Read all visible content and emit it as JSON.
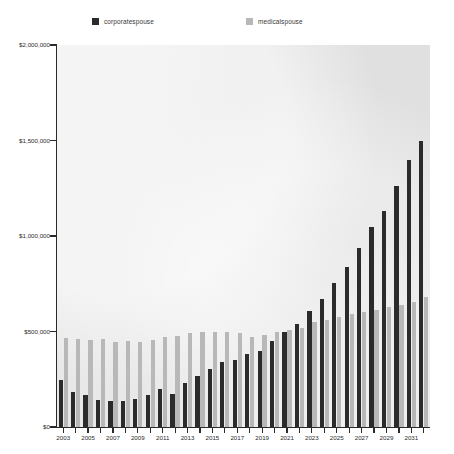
{
  "legend": {
    "items": [
      {
        "label": "corporatespouse",
        "color": "#2b2b2b",
        "icon": "square-swatch-icon"
      },
      {
        "label": "medicalspouse",
        "color": "#b8b8b8",
        "icon": "square-swatch-icon"
      }
    ]
  },
  "axes": {
    "y_ticks": [
      "$2,000,000",
      "$1,500,000",
      "$1,000,000",
      "$500,000",
      "$0"
    ],
    "x_ticks": [
      "2003",
      "2005",
      "2007",
      "2009",
      "2011",
      "2013",
      "2015",
      "2017",
      "2019",
      "2021",
      "2023",
      "2025",
      "2027",
      "2029",
      "2031"
    ]
  },
  "chart_data": {
    "type": "bar",
    "title": "",
    "subtitle": "",
    "xlabel": "",
    "ylabel": "",
    "ylim": [
      0,
      2000000
    ],
    "ytick_values": [
      2000000,
      1500000,
      1000000,
      500000,
      0
    ],
    "ytick_labels": [
      "$2,000,000",
      "$1,500,000",
      "$1,000,000",
      "$500,000",
      "$0"
    ],
    "grid": false,
    "legend_position": "top",
    "categories": [
      "2003",
      "2004",
      "2005",
      "2006",
      "2007",
      "2008",
      "2009",
      "2010",
      "2011",
      "2012",
      "2013",
      "2014",
      "2015",
      "2016",
      "2017",
      "2018",
      "2019",
      "2020",
      "2021",
      "2022",
      "2023",
      "2024",
      "2025",
      "2026",
      "2027",
      "2028",
      "2029",
      "2030",
      "2031",
      "2032"
    ],
    "series": [
      {
        "name": "corporatespouse",
        "color": "#2b2b2b",
        "values": [
          248000,
          185000,
          168000,
          142000,
          137000,
          138000,
          145000,
          170000,
          198000,
          172000,
          232000,
          268000,
          305000,
          340000,
          352000,
          382000,
          398000,
          452000,
          500000,
          540000,
          610000,
          672000,
          752000,
          840000,
          935000,
          1048000,
          1130000,
          1262000,
          1400000,
          1500000
        ]
      },
      {
        "name": "medicalspouse",
        "color": "#b8b8b8",
        "values": [
          465000,
          462000,
          455000,
          460000,
          445000,
          450000,
          443000,
          458000,
          470000,
          478000,
          492000,
          500000,
          495000,
          500000,
          490000,
          472000,
          480000,
          495000,
          510000,
          520000,
          548000,
          560000,
          578000,
          590000,
          600000,
          612000,
          628000,
          640000,
          655000,
          682000
        ]
      }
    ]
  }
}
